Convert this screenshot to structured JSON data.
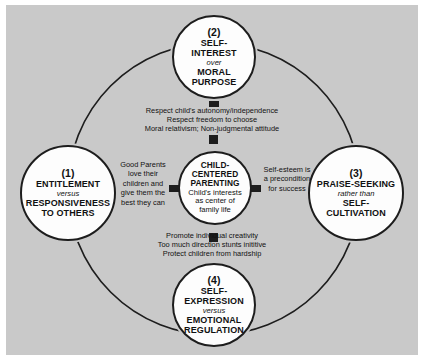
{
  "diagram": {
    "type": "circular-relationship-diagram",
    "background_color": "#c9c9c9",
    "node_fill": "#fdfdfd",
    "stroke_color": "#1d1d1d",
    "center": {
      "title_line1": "CHILD-",
      "title_line2": "CENTERED",
      "title_line3": "PARENTING",
      "sub_line1": "Child's interests",
      "sub_line2": "as center of",
      "sub_line3": "family life"
    },
    "nodes": [
      {
        "id": "entitlement",
        "position": "left",
        "number": "(1)",
        "title_top": "ENTITLEMENT",
        "connector_word": "versus",
        "title_bottom_line1": "RESPONSIVENESS",
        "title_bottom_line2": "TO OTHERS"
      },
      {
        "id": "self-interest",
        "position": "top",
        "number": "(2)",
        "title_top_line1": "SELF-",
        "title_top_line2": "INTEREST",
        "connector_word": "over",
        "title_bottom_line1": "MORAL",
        "title_bottom_line2": "PURPOSE"
      },
      {
        "id": "praise-seeking",
        "position": "right",
        "number": "(3)",
        "title_top": "PRAISE-SEEKING",
        "connector_word": "rather than",
        "title_bottom_line1": "SELF-",
        "title_bottom_line2": "CULTIVATION"
      },
      {
        "id": "self-expression",
        "position": "bottom",
        "number": "(4)",
        "title_top_line1": "SELF-",
        "title_top_line2": "EXPRESSION",
        "connector_word": "versus",
        "title_bottom_line1": "EMOTIONAL",
        "title_bottom_line2": "REGULATION"
      }
    ],
    "connector_texts": [
      {
        "id": "top-block",
        "position": "top",
        "lines": [
          "Respect child's autonomy/independence",
          "Respect freedom to choose",
          "Moral relativism; Non-judgmental attitude"
        ]
      },
      {
        "id": "left-block",
        "position": "left",
        "lines": [
          "Good Parents",
          "love their",
          "children and",
          "give them the",
          "best they can"
        ]
      },
      {
        "id": "right-block",
        "position": "right",
        "lines": [
          "Self-esteem is",
          "a precondition",
          "for success"
        ]
      },
      {
        "id": "bottom-block",
        "position": "bottom",
        "lines": [
          "Promote individual creativity",
          "Too much direction stunts inititive",
          "Protect children from hardship"
        ]
      }
    ]
  }
}
